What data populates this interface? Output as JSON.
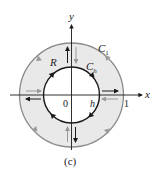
{
  "figure": {
    "caption": "(c)",
    "colors": {
      "background": "#ffffff",
      "region_fill": "#e9e9e9",
      "outer_circle": "#8c8c8c",
      "inner_circle": "#1a1a1a",
      "axis": "#1a1a1a",
      "gray_arrow": "#9a9a9a",
      "black_arrow": "#1a1a1a"
    },
    "axes": {
      "x_label": "x",
      "y_label": "y",
      "origin_label": "0"
    },
    "labels": {
      "region": "R",
      "outer_curve": "C",
      "outer_curve_sub": "1",
      "inner_curve": "C",
      "inner_curve_sub": "h",
      "inner_radius": "h",
      "outer_radius": "1"
    },
    "curves": {
      "outer": {
        "name": "C1",
        "radius": 1,
        "orientation": "counterclockwise"
      },
      "inner": {
        "name": "Ch",
        "radius": "h",
        "orientation": "clockwise"
      }
    }
  }
}
